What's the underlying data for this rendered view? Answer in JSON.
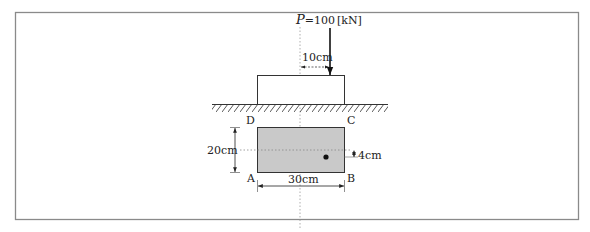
{
  "diagram": {
    "type": "eccentric-load-footing",
    "colors": {
      "frame": "#8a8a8a",
      "line": "#333333",
      "section_fill": "#c9c9c9",
      "axis": "#999999",
      "text": "#222222"
    },
    "load": {
      "symbol": "P",
      "equals_value": "=100",
      "unit": "[kN]"
    },
    "dimensions": {
      "eccentricity_x": "10cm",
      "height": "20cm",
      "width": "30cm",
      "eccentricity_y": "4cm"
    },
    "corners": {
      "top_left": "D",
      "top_right": "C",
      "bottom_left": "A",
      "bottom_right": "B"
    }
  }
}
